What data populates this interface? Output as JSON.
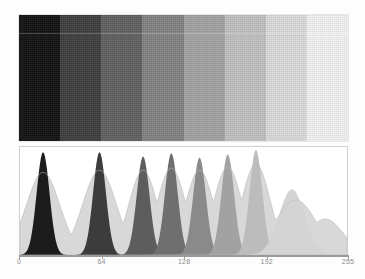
{
  "figure": {
    "background_color": "#fdfdfd"
  },
  "wedge": {
    "name": "grayscale-step-wedge",
    "step_count": 8,
    "noise": "film grain",
    "bands": [
      {
        "label": "step-1",
        "gray_value": 18,
        "color": "#121212"
      },
      {
        "label": "step-2",
        "gray_value": 62,
        "color": "#3e3e3e"
      },
      {
        "label": "step-3",
        "gray_value": 96,
        "color": "#606060"
      },
      {
        "label": "step-4",
        "gray_value": 130,
        "color": "#828282"
      },
      {
        "label": "step-5",
        "gray_value": 163,
        "color": "#a3a3a3"
      },
      {
        "label": "step-6",
        "gray_value": 192,
        "color": "#c0c0c0"
      },
      {
        "label": "step-7",
        "gray_value": 219,
        "color": "#dbdbdb"
      },
      {
        "label": "step-8",
        "gray_value": 242,
        "color": "#f2f2f2"
      }
    ]
  },
  "axis": {
    "name": "intensity-axis",
    "min": 0,
    "max": 255,
    "tick_labels": [
      "0",
      "64",
      "128",
      "192",
      "255"
    ],
    "tick_values": [
      0,
      64,
      128,
      192,
      255
    ],
    "color": "#9a9a9a"
  },
  "chart_data": {
    "type": "line",
    "xlabel": "",
    "ylabel": "",
    "xlim": [
      0,
      255
    ],
    "ylim": [
      0,
      1
    ],
    "grid": false,
    "legend": "none",
    "x_tick_labels": [
      "0",
      "64",
      "128",
      "192",
      "255"
    ],
    "x_ticks": [
      0,
      64,
      128,
      192,
      255
    ],
    "series": [
      {
        "name": "core-peaks",
        "fill_color": "#5a5a5a",
        "peaks": [
          {
            "center": 18,
            "height": 0.97,
            "width": 5,
            "color": "#1c1c1c"
          },
          {
            "center": 62,
            "height": 0.97,
            "width": 5,
            "color": "#3c3c3c"
          },
          {
            "center": 96,
            "height": 0.93,
            "width": 5,
            "color": "#5d5d5d"
          },
          {
            "center": 118,
            "height": 0.96,
            "width": 5,
            "color": "#6f6f6f"
          },
          {
            "center": 140,
            "height": 0.92,
            "width": 5,
            "color": "#8a8a8a"
          },
          {
            "center": 162,
            "height": 0.95,
            "width": 5,
            "color": "#a2a2a2"
          },
          {
            "center": 184,
            "height": 0.99,
            "width": 5,
            "color": "#bcbcbc"
          },
          {
            "center": 212,
            "height": 0.62,
            "width": 10,
            "color": "#d4d4d4"
          }
        ]
      },
      {
        "name": "envelope-peaks",
        "fill_color": "#d8d8d8",
        "peaks": [
          {
            "center": 18,
            "height": 0.78,
            "width": 13,
            "color": "#cfcfcf"
          },
          {
            "center": 62,
            "height": 0.8,
            "width": 13,
            "color": "#cfcfcf"
          },
          {
            "center": 96,
            "height": 0.8,
            "width": 11,
            "color": "#d2d2d2"
          },
          {
            "center": 118,
            "height": 0.82,
            "width": 11,
            "color": "#d4d4d4"
          },
          {
            "center": 140,
            "height": 0.8,
            "width": 11,
            "color": "#d8d8d8"
          },
          {
            "center": 162,
            "height": 0.83,
            "width": 11,
            "color": "#dcdcdc"
          },
          {
            "center": 184,
            "height": 0.86,
            "width": 11,
            "color": "#e0e0e0"
          },
          {
            "center": 215,
            "height": 0.52,
            "width": 16,
            "color": "#e6e6e6"
          },
          {
            "center": 238,
            "height": 0.34,
            "width": 14,
            "color": "#ececec"
          }
        ]
      }
    ]
  }
}
